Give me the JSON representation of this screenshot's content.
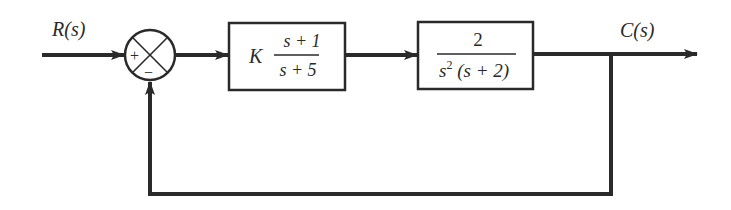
{
  "diagram": {
    "type": "feedback-control-block-diagram",
    "input_label": "R(s)",
    "output_label": "C(s)",
    "summing_junction": {
      "plus_sign": "+",
      "minus_sign": "−"
    },
    "blocks": [
      {
        "gain": "K",
        "numerator": "s + 1",
        "denominator": "s + 5"
      },
      {
        "numerator": "2",
        "denominator_base": "s",
        "denominator_exp": "2",
        "denominator_rest": " (s + 2)"
      }
    ],
    "feedback": "unity negative feedback",
    "colors": {
      "line": "#2a2a2a",
      "background": "#ffffff"
    }
  }
}
